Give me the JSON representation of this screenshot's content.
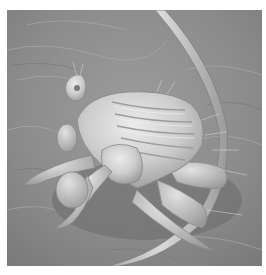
{
  "image": {
    "description": "Grayscale scanning electron micrograph of a louse clinging to a hair strand on a skin surface",
    "subject": "louse",
    "secondary_subject": "hair strand",
    "background": "skin surface texture",
    "palette": {
      "background": "#8f8f8f",
      "background_light": "#a6a6a6",
      "background_dark": "#6e6e6e",
      "hair": "#c4c4c4",
      "hair_shadow": "#7a7a7a",
      "body": "#cfcfcf",
      "body_highlight": "#e8e8e8",
      "body_shadow": "#8a8a8a",
      "border": "#ffffff"
    }
  }
}
